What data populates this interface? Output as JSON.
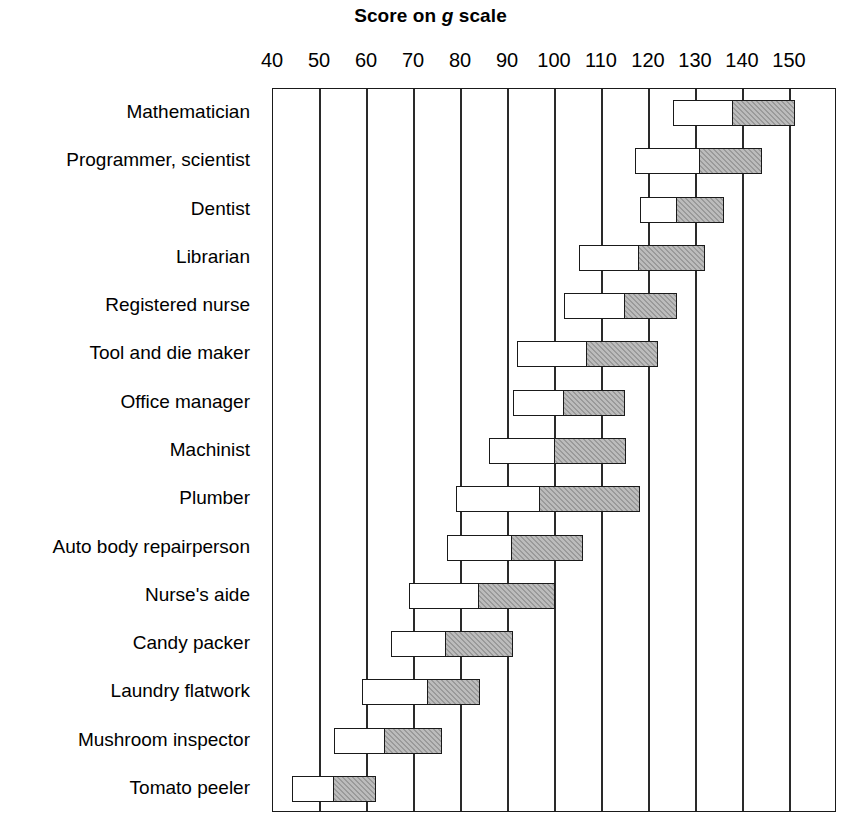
{
  "chart_data": {
    "type": "bar",
    "title": "Score on g scale",
    "title_plain": "Score on ",
    "title_italic": "g",
    "title_tail": " scale",
    "xlabel": "",
    "ylabel": "",
    "xlim": [
      40,
      160
    ],
    "grid": true,
    "orientation": "horizontal",
    "legend_position": "none",
    "x_ticks": [
      40,
      50,
      60,
      70,
      80,
      90,
      100,
      110,
      120,
      130,
      140,
      150
    ],
    "x_tick_labels": [
      "40",
      "50",
      "60",
      "70",
      "80",
      "90",
      "100",
      "110",
      "120",
      "130",
      "140",
      "150"
    ],
    "categories": [
      "Mathematician",
      "Programmer, scientist",
      "Dentist",
      "Librarian",
      "Registered nurse",
      "Tool and die maker",
      "Office manager",
      "Machinist",
      "Plumber",
      "Auto body repairperson",
      "Nurse's aide",
      "Candy packer",
      "Laundry flatwork",
      "Mushroom inspector",
      "Tomato peeler"
    ],
    "series": [
      {
        "name": "lower range (open bar)",
        "color": "#ffffff",
        "values": [
          [
            125,
            138
          ],
          [
            117,
            131
          ],
          [
            118,
            126
          ],
          [
            105,
            118
          ],
          [
            102,
            115
          ],
          [
            92,
            107
          ],
          [
            91,
            102
          ],
          [
            86,
            100
          ],
          [
            79,
            97
          ],
          [
            77,
            91
          ],
          [
            69,
            84
          ],
          [
            65,
            77
          ],
          [
            59,
            73
          ],
          [
            53,
            64
          ],
          [
            44,
            53
          ]
        ]
      },
      {
        "name": "upper range (hatched bar)",
        "color": "#9a9a9a",
        "values": [
          [
            138,
            151
          ],
          [
            131,
            144
          ],
          [
            126,
            136
          ],
          [
            118,
            132
          ],
          [
            115,
            126
          ],
          [
            107,
            122
          ],
          [
            102,
            115
          ],
          [
            100,
            115
          ],
          [
            97,
            118
          ],
          [
            91,
            106
          ],
          [
            84,
            100
          ],
          [
            77,
            91
          ],
          [
            73,
            84
          ],
          [
            64,
            76
          ],
          [
            53,
            62
          ]
        ]
      }
    ],
    "rows": [
      {
        "category": "Mathematician",
        "low": 125,
        "mid": 138,
        "high": 151
      },
      {
        "category": "Programmer, scientist",
        "low": 117,
        "mid": 131,
        "high": 144
      },
      {
        "category": "Dentist",
        "low": 118,
        "mid": 126,
        "high": 136
      },
      {
        "category": "Librarian",
        "low": 105,
        "mid": 118,
        "high": 132
      },
      {
        "category": "Registered nurse",
        "low": 102,
        "mid": 115,
        "high": 126
      },
      {
        "category": "Tool and die maker",
        "low": 92,
        "mid": 107,
        "high": 122
      },
      {
        "category": "Office manager",
        "low": 91,
        "mid": 102,
        "high": 115
      },
      {
        "category": "Machinist",
        "low": 86,
        "mid": 100,
        "high": 115
      },
      {
        "category": "Plumber",
        "low": 79,
        "mid": 97,
        "high": 118
      },
      {
        "category": "Auto body repairperson",
        "low": 77,
        "mid": 91,
        "high": 106
      },
      {
        "category": "Nurse's aide",
        "low": 69,
        "mid": 84,
        "high": 100
      },
      {
        "category": "Candy packer",
        "low": 65,
        "mid": 77,
        "high": 91
      },
      {
        "category": "Laundry flatwork",
        "low": 59,
        "mid": 73,
        "high": 84
      },
      {
        "category": "Mushroom inspector",
        "low": 53,
        "mid": 64,
        "high": 76
      },
      {
        "category": "Tomato peeler",
        "low": 44,
        "mid": 53,
        "high": 62
      }
    ]
  },
  "colors": {
    "axis": "#1a1a1a",
    "grid": "#2a2a2a",
    "bar_low": "#ffffff",
    "bar_high": "#9a9a9a",
    "background": "#ffffff"
  }
}
